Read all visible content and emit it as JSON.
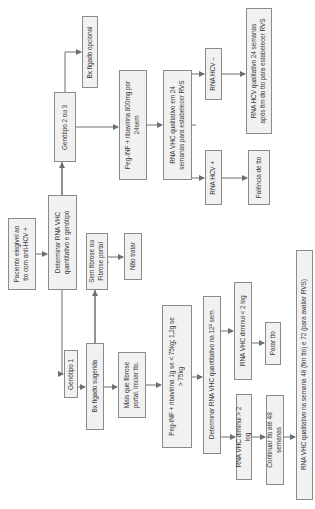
{
  "diagram": {
    "orientation": "rotated-90-ccw",
    "type": "flowchart",
    "language": "pt",
    "nodes": {
      "start": "Paciente elegível ao tto com anti-HCV +",
      "determine_rna": "Determinar RNA VHC quantitativo e genótipo",
      "genotype_2_3": "Genótipo 2 ou 3",
      "biopsy_optional": "Bx fígado opcional",
      "peg_inf_800": "Peg-INF + ribavirina 800mg por 24sem",
      "rna_qual_24": "RNA VHC qualitativo em 24 semanas para estabelecer RVS",
      "rna_hcv_neg": "RNA HCV –",
      "rna_hcv_pos": "RNA HCV +",
      "rna_qual_24_after": "RNA HCV qualitativo 24 semanas após fim do tto para estabelecer RVS",
      "treatment_failure": "Falência de tto",
      "no_fibrosis": "Sem fibrose ou Fibrose portal",
      "do_not_treat": "Não tratar",
      "genotype_1": "Genótipo 1",
      "biopsy_suggested": "Bx fígado sugerida",
      "more_than_portal": "Mais que fibrose portal. Iniciar tto.",
      "peg_inf_weight": "Peg-INF + ribavirina 1g se < 75kg; 1,2g se > 75kg",
      "determine_12wk": "Determinar RNA VHC quantitativo na 12ª sem",
      "decrease_lt_2log": "RNA VHC diminui < 2 log",
      "stop_treatment": "Parar tto",
      "decrease_gt_2log": "RNA VHC diminui > 2 log",
      "continue_48": "Continuar tto até 48 semanas",
      "rna_qual_48_72": "RNA VHC qualitativo na semana 48 (fim tto) e 72 (para avaliar RVS)"
    },
    "edges": [
      [
        "start",
        "determine_rna"
      ],
      [
        "determine_rna",
        "genotype_2_3"
      ],
      [
        "determine_rna",
        "genotype_1"
      ],
      [
        "genotype_2_3",
        "biopsy_optional"
      ],
      [
        "genotype_2_3",
        "peg_inf_800"
      ],
      [
        "peg_inf_800",
        "rna_qual_24"
      ],
      [
        "rna_qual_24",
        "rna_hcv_neg"
      ],
      [
        "rna_qual_24",
        "rna_hcv_pos"
      ],
      [
        "rna_hcv_neg",
        "rna_qual_24_after"
      ],
      [
        "rna_hcv_pos",
        "treatment_failure"
      ],
      [
        "genotype_1",
        "biopsy_suggested"
      ],
      [
        "biopsy_suggested",
        "no_fibrosis"
      ],
      [
        "no_fibrosis",
        "do_not_treat"
      ],
      [
        "biopsy_suggested",
        "more_than_portal"
      ],
      [
        "more_than_portal",
        "peg_inf_weight"
      ],
      [
        "peg_inf_weight",
        "determine_12wk"
      ],
      [
        "determine_12wk",
        "decrease_lt_2log"
      ],
      [
        "determine_12wk",
        "decrease_gt_2log"
      ],
      [
        "decrease_lt_2log",
        "stop_treatment"
      ],
      [
        "decrease_gt_2log",
        "continue_48"
      ],
      [
        "continue_48",
        "rna_qual_48_72"
      ]
    ]
  },
  "colors": {
    "box_fill": "#f1f1f1",
    "box_border": "#8a8a8a",
    "line": "#6e6e6e",
    "text": "#3a3a3a"
  }
}
